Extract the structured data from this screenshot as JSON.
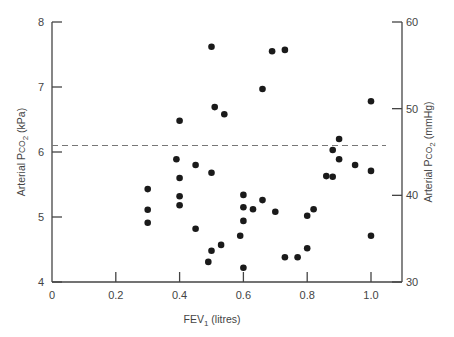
{
  "chart_data": {
    "type": "scatter",
    "title": "",
    "xlabel": "FEV1 (litres)",
    "ylabel": "Arterial PCO2 (kPa)",
    "ylabel_right": "Arterial PCO2 (mmHg)",
    "xlim": [
      0,
      1.1
    ],
    "ylim": [
      4,
      8
    ],
    "ylim_right": [
      30,
      60
    ],
    "x_ticks": [
      "0",
      "0.2",
      "0.4",
      "0.6",
      "0.8",
      "1.0"
    ],
    "y_ticks": [
      "4",
      "5",
      "6",
      "7",
      "8"
    ],
    "y_ticks_right": [
      "30",
      "40",
      "50",
      "60"
    ],
    "grid": false,
    "reference_line": {
      "style": "dashed",
      "y_kpa": 6.1
    },
    "points": [
      [
        0.5,
        7.62
      ],
      [
        0.69,
        7.55
      ],
      [
        0.73,
        7.57
      ],
      [
        0.66,
        6.97
      ],
      [
        0.51,
        6.69
      ],
      [
        0.54,
        6.58
      ],
      [
        0.4,
        6.48
      ],
      [
        1.0,
        6.78
      ],
      [
        0.9,
        6.2
      ],
      [
        0.88,
        6.03
      ],
      [
        0.9,
        5.89
      ],
      [
        0.95,
        5.8
      ],
      [
        1.0,
        5.71
      ],
      [
        0.86,
        5.63
      ],
      [
        0.88,
        5.62
      ],
      [
        0.39,
        5.89
      ],
      [
        0.45,
        5.8
      ],
      [
        0.5,
        5.68
      ],
      [
        0.4,
        5.6
      ],
      [
        0.3,
        5.43
      ],
      [
        0.3,
        5.11
      ],
      [
        0.3,
        4.91
      ],
      [
        0.4,
        5.32
      ],
      [
        0.4,
        5.18
      ],
      [
        0.6,
        5.34
      ],
      [
        0.66,
        5.26
      ],
      [
        0.6,
        5.15
      ],
      [
        0.63,
        5.12
      ],
      [
        0.7,
        5.08
      ],
      [
        0.82,
        5.12
      ],
      [
        0.8,
        5.02
      ],
      [
        0.6,
        4.94
      ],
      [
        0.45,
        4.82
      ],
      [
        0.59,
        4.71
      ],
      [
        0.53,
        4.57
      ],
      [
        0.5,
        4.48
      ],
      [
        0.49,
        4.31
      ],
      [
        0.6,
        4.22
      ],
      [
        0.73,
        4.38
      ],
      [
        0.77,
        4.38
      ],
      [
        0.8,
        4.52
      ],
      [
        1.0,
        4.71
      ]
    ]
  },
  "labels": {
    "xlabel_main": "FEV",
    "xlabel_sub": "1",
    "xlabel_unit": " (litres)",
    "ylabel_left_main": "Arterial P",
    "ylabel_left_co": "CO",
    "ylabel_left_sub": "2",
    "ylabel_left_unit": " (kPa)",
    "ylabel_right_main": "Arterial P",
    "ylabel_right_co": "CO",
    "ylabel_right_sub": "2",
    "ylabel_right_unit": " (mmHg)"
  },
  "colors": {
    "axis": "#444444",
    "point": "#1a1a1a",
    "dashed": "#777777"
  }
}
